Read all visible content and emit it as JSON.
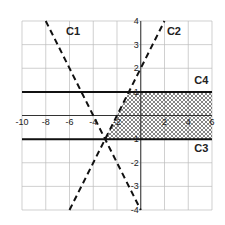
{
  "chart_data": {
    "type": "line",
    "title": "",
    "xlabel": "",
    "ylabel": "",
    "xlim": [
      -10,
      6
    ],
    "ylim": [
      -4,
      4
    ],
    "grid": true,
    "x_ticks": [
      -10,
      -8,
      -6,
      -4,
      -2,
      2,
      4,
      6
    ],
    "x_tick_labels": [
      "-10",
      "-8",
      "-6",
      "-4",
      "-2",
      "2",
      "4",
      "6"
    ],
    "y_ticks": [
      4,
      3,
      2,
      1,
      -1,
      -2,
      -3,
      -4
    ],
    "y_tick_labels": [
      "4",
      "3",
      "2",
      "1",
      "-1",
      "-2",
      "-3",
      "-4"
    ],
    "series": [
      {
        "name": "C1",
        "style": "dashed",
        "equation": "y = -x - 4",
        "x": [
          -8,
          0
        ],
        "y": [
          4,
          -4
        ]
      },
      {
        "name": "C2",
        "style": "dashed",
        "equation": "y = x + 2",
        "x": [
          -6,
          2
        ],
        "y": [
          -4,
          4
        ]
      },
      {
        "name": "C3",
        "style": "solid",
        "equation": "y = -1",
        "x": [
          -10,
          6
        ],
        "y": [
          -1,
          -1
        ]
      },
      {
        "name": "C4",
        "style": "solid",
        "equation": "y = 1",
        "x": [
          -10,
          6
        ],
        "y": [
          1,
          1
        ]
      }
    ],
    "labels": [
      {
        "text": "C1",
        "x": -6.3,
        "y": 3.4
      },
      {
        "text": "C2",
        "x": 2.2,
        "y": 3.4
      },
      {
        "text": "C4",
        "x": 4.5,
        "y": 1.35
      },
      {
        "text": "C3",
        "x": 4.5,
        "y": -1.55
      }
    ],
    "shaded_region": {
      "description": "between C3 and C4, right of C2",
      "polygon": [
        [
          -3,
          -1
        ],
        [
          6,
          -1
        ],
        [
          6,
          1
        ],
        [
          -1,
          1
        ]
      ],
      "pattern": "crosshatch"
    }
  }
}
